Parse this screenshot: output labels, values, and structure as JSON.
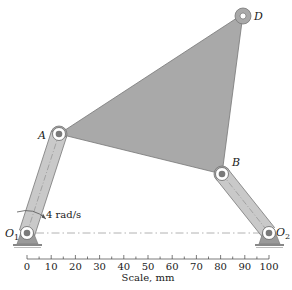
{
  "figure": {
    "type": "four-bar linkage with triangular coupler",
    "colors": {
      "link_fill": "#a9a9a9",
      "link_stroke": "#6e6e6e",
      "crank_fill": "#c8c8c8",
      "pin_fill": "#7a7a7a",
      "ground_fill": "#9a9a9a",
      "centerline": "#9a9a9a",
      "text": "#1a1a1a"
    },
    "points": {
      "O1": {
        "label": "O",
        "sub": "1"
      },
      "O2": {
        "label": "O",
        "sub": "2"
      },
      "A": {
        "label": "A"
      },
      "B": {
        "label": "B"
      },
      "D": {
        "label": "D"
      }
    },
    "angular_velocity": {
      "label": "4 rad/s"
    },
    "scale": {
      "title": "Scale, mm",
      "ticks": [
        "0",
        "10",
        "20",
        "30",
        "40",
        "50",
        "60",
        "70",
        "80",
        "90",
        "100"
      ]
    }
  }
}
